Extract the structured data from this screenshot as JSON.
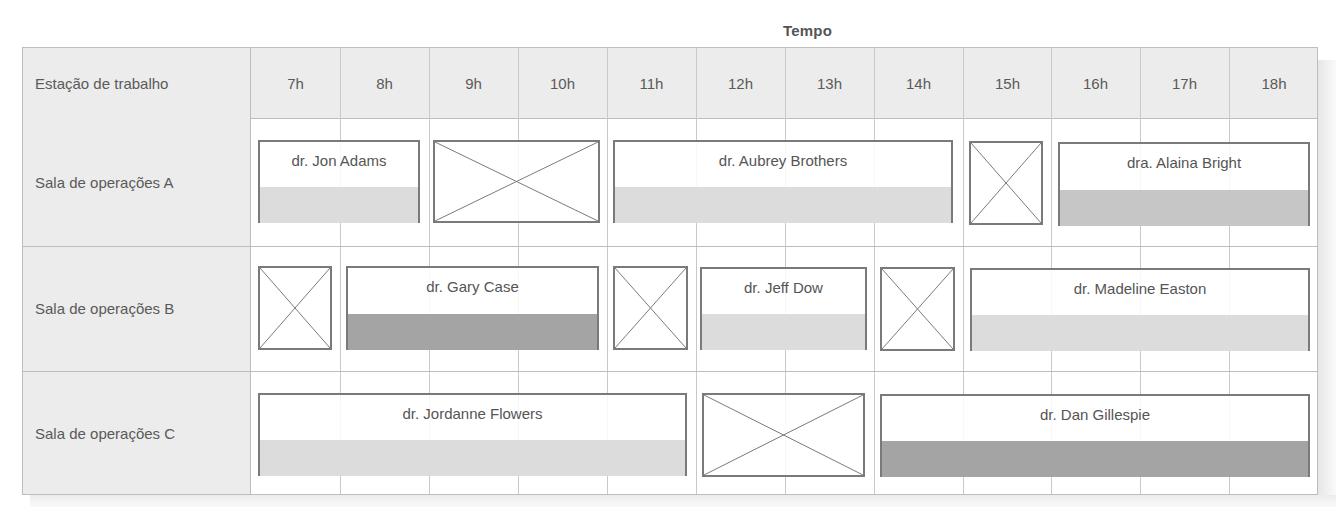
{
  "header": {
    "title": "Tempo",
    "workstation_label": "Estação de trabalho"
  },
  "hours": [
    "7h",
    "8h",
    "9h",
    "10h",
    "11h",
    "12h",
    "13h",
    "14h",
    "15h",
    "16h",
    "17h",
    "18h"
  ],
  "rooms": [
    {
      "label": "Sala de operações A",
      "blocks": [
        {
          "type": "booking",
          "surgeon": "dr. Jon Adams",
          "fill": "light"
        },
        {
          "type": "unavailable"
        },
        {
          "type": "booking",
          "surgeon": "dr. Aubrey Brothers",
          "fill": "light"
        },
        {
          "type": "unavailable"
        },
        {
          "type": "booking",
          "surgeon": "dra. Alaina Bright",
          "fill": "medium"
        }
      ]
    },
    {
      "label": "Sala de operações B",
      "blocks": [
        {
          "type": "unavailable"
        },
        {
          "type": "booking",
          "surgeon": "dr. Gary Case",
          "fill": "dark"
        },
        {
          "type": "unavailable"
        },
        {
          "type": "booking",
          "surgeon": "dr. Jeff Dow",
          "fill": "light"
        },
        {
          "type": "unavailable"
        },
        {
          "type": "booking",
          "surgeon": "dr. Madeline Easton",
          "fill": "light"
        }
      ]
    },
    {
      "label": "Sala de operações C",
      "blocks": [
        {
          "type": "booking",
          "surgeon": "dr. Jordanne Flowers",
          "fill": "light"
        },
        {
          "type": "unavailable"
        },
        {
          "type": "booking",
          "surgeon": "dr. Dan Gillespie",
          "fill": "dark"
        }
      ]
    }
  ],
  "colors": {
    "header_bg": "#ececec",
    "border": "#7a7a7a",
    "fill_light": "#dcdcdc",
    "fill_medium": "#c6c6c6",
    "fill_dark": "#a4a4a4"
  }
}
